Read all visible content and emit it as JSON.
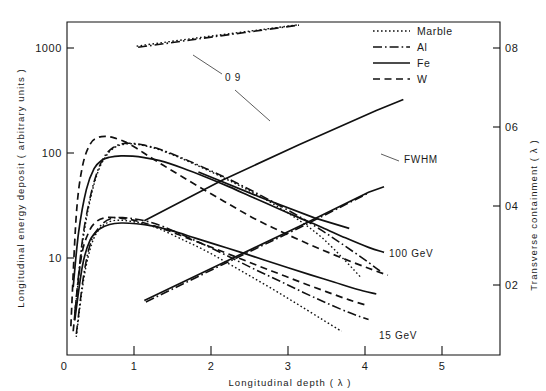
{
  "figure": {
    "title": "",
    "axes": {
      "x": {
        "label": "Longitudinal  depth  ( λ )",
        "ticks": [
          "0",
          "1",
          "2",
          "3",
          "4",
          "5"
        ],
        "values": [
          0,
          1,
          2,
          3,
          4,
          5
        ],
        "range": [
          0,
          5.6
        ],
        "scale": "linear"
      },
      "y_left": {
        "label": "Longitudinal  energy  deposit  ( arbitrary  units )",
        "ticks": [
          "10",
          "100",
          "1000"
        ],
        "values": [
          10,
          100,
          1000
        ],
        "range": [
          2.2,
          2200
        ],
        "scale": "log"
      },
      "y_right": {
        "label": "Transverse  containment  ( λ )",
        "ticks": [
          "02",
          "04",
          "06",
          "08"
        ],
        "values": [
          0.2,
          0.4,
          0.6,
          0.8
        ],
        "range": [
          0.0,
          0.855
        ],
        "scale": "linear"
      }
    },
    "legend": {
      "position": "top-right",
      "items": [
        {
          "label": "Marble",
          "style": "dotted",
          "key": "marble"
        },
        {
          "label": "Al",
          "style": "dash-dot",
          "key": "al"
        },
        {
          "label": "Fe",
          "style": "solid",
          "key": "fe"
        },
        {
          "label": "W",
          "style": "dashed",
          "key": "w"
        }
      ]
    },
    "annotations": [
      {
        "name": "containment-09",
        "text": "0 9",
        "x": 225,
        "y": 81
      },
      {
        "name": "fwhm",
        "text": "FWHM",
        "x": 404,
        "y": 163
      },
      {
        "name": "energy-100gev",
        "text": "100 GeV",
        "x": 389,
        "y": 257
      },
      {
        "name": "energy-15gev",
        "text": "15 GeV",
        "x": 379,
        "y": 339
      }
    ]
  },
  "chart_data": {
    "type": "line",
    "title": "",
    "xlabel": "Longitudinal depth ( λ )",
    "ylabel": "Longitudinal energy deposit ( arbitrary units )",
    "ylabel_right": "Transverse containment ( λ )",
    "xlim": [
      0,
      5.6
    ],
    "ylim": [
      2.2,
      2200
    ],
    "ylim_right": [
      0.0,
      0.855
    ],
    "yscale": "log",
    "grid": false,
    "legend_position": "top-right",
    "legend": [
      "Marble",
      "Al",
      "Fe",
      "W"
    ],
    "annotations": [
      "0 9",
      "FWHM",
      "100 GeV",
      "15 GeV"
    ],
    "series": [
      {
        "name": "Marble 100 GeV longitudinal deposit",
        "material": "Marble",
        "energy": "100 GeV",
        "axis": "left",
        "style": "dotted",
        "x": [
          0.1,
          0.2,
          0.3,
          0.4,
          0.5,
          0.6,
          0.7,
          0.8,
          0.9,
          1.0,
          1.2,
          1.5,
          1.8,
          2.1,
          2.4,
          2.7,
          3.0,
          3.3,
          3.6,
          3.8
        ],
        "y": [
          5.0,
          22,
          55,
          98,
          135,
          160,
          172,
          176,
          174,
          169,
          155,
          128,
          103,
          82,
          64,
          49,
          36,
          25,
          15.5,
          11.0
        ]
      },
      {
        "name": "Al 100 GeV longitudinal deposit",
        "material": "Al",
        "energy": "100 GeV",
        "axis": "left",
        "style": "dash-dot",
        "x": [
          0.1,
          0.2,
          0.3,
          0.4,
          0.5,
          0.6,
          0.7,
          0.8,
          0.9,
          1.0,
          1.2,
          1.5,
          1.8,
          2.1,
          2.4,
          2.7,
          3.0,
          3.3,
          3.6,
          3.9,
          4.05
        ],
        "y": [
          5.2,
          24,
          58,
          102,
          140,
          163,
          175,
          178,
          176,
          171,
          157,
          130,
          105,
          84,
          66,
          51,
          39,
          29,
          21,
          15,
          12.5
        ]
      },
      {
        "name": "Fe 100 GeV longitudinal deposit",
        "material": "Fe",
        "energy": "100 GeV",
        "axis": "left",
        "style": "solid",
        "x": [
          0.08,
          0.15,
          0.25,
          0.35,
          0.45,
          0.55,
          0.7,
          0.85,
          1.0,
          1.2,
          1.5,
          1.8,
          2.1,
          2.4,
          2.7,
          3.0,
          3.3,
          3.6,
          3.9,
          4.1
        ],
        "y": [
          9,
          28,
          68,
          105,
          125,
          133,
          137,
          136,
          132,
          124,
          106,
          88,
          72,
          58,
          47,
          38,
          31,
          25,
          20.5,
          18.5
        ]
      },
      {
        "name": "W 100 GeV longitudinal deposit",
        "material": "W",
        "energy": "100 GeV",
        "axis": "left",
        "style": "dashed",
        "x": [
          0.05,
          0.12,
          0.2,
          0.3,
          0.4,
          0.5,
          0.6,
          0.75,
          0.9,
          1.05,
          1.25,
          1.5,
          1.8,
          2.1,
          2.4,
          2.7,
          3.0,
          3.3,
          3.6,
          3.9,
          4.15
        ],
        "y": [
          4.0,
          40,
          110,
          175,
          200,
          205,
          200,
          183,
          160,
          137,
          112,
          88,
          66,
          50,
          38,
          30,
          24,
          19.5,
          16.0,
          13.3,
          11.5
        ]
      },
      {
        "name": "Marble 15 GeV longitudinal deposit",
        "material": "Marble",
        "energy": "15 GeV",
        "axis": "left",
        "style": "dotted",
        "x": [
          0.12,
          0.22,
          0.32,
          0.42,
          0.55,
          0.7,
          0.85,
          1.0,
          1.2,
          1.5,
          1.8,
          2.1,
          2.4,
          2.7,
          3.0,
          3.3,
          3.55
        ],
        "y": [
          3.2,
          11,
          22,
          30,
          35,
          36,
          35,
          33.5,
          30,
          24,
          19,
          14.5,
          11.0,
          8.3,
          6.2,
          4.6,
          3.6
        ]
      },
      {
        "name": "Al 15 GeV longitudinal deposit",
        "material": "Al",
        "energy": "15 GeV",
        "axis": "left",
        "style": "dash-dot",
        "x": [
          0.12,
          0.22,
          0.32,
          0.45,
          0.58,
          0.72,
          0.88,
          1.05,
          1.25,
          1.55,
          1.85,
          2.15,
          2.45,
          2.75,
          3.05,
          3.35,
          3.65,
          3.9
        ],
        "y": [
          3.4,
          12,
          24,
          33,
          37.5,
          38,
          37,
          35,
          31.5,
          25.5,
          20.5,
          16.2,
          12.8,
          10.2,
          8.1,
          6.5,
          5.3,
          4.6
        ]
      },
      {
        "name": "Fe 15 GeV longitudinal deposit",
        "material": "Fe",
        "energy": "15 GeV",
        "axis": "left",
        "style": "solid",
        "x": [
          0.1,
          0.2,
          0.3,
          0.42,
          0.55,
          0.7,
          0.9,
          1.1,
          1.35,
          1.65,
          1.95,
          2.25,
          2.55,
          2.85,
          3.15,
          3.45,
          3.75,
          4.0
        ],
        "y": [
          4.5,
          14,
          24,
          30,
          33,
          34,
          33.5,
          32,
          29,
          25,
          21.5,
          18.5,
          15.8,
          13.5,
          11.6,
          10.0,
          8.6,
          7.8
        ]
      },
      {
        "name": "W 15 GeV longitudinal deposit",
        "material": "W",
        "energy": "15 GeV",
        "axis": "left",
        "style": "dashed",
        "x": [
          0.08,
          0.18,
          0.28,
          0.38,
          0.5,
          0.65,
          0.82,
          1.0,
          1.25,
          1.55,
          1.85,
          2.15,
          2.45,
          2.75,
          3.05,
          3.35,
          3.65,
          3.9
        ],
        "y": [
          3.6,
          16,
          28,
          35,
          38,
          38,
          36.5,
          34,
          30,
          25,
          20.8,
          17.2,
          14.2,
          11.8,
          9.8,
          8.2,
          6.9,
          6.1
        ]
      },
      {
        "name": "Marble 0.9 transverse containment",
        "material": "Marble",
        "quantity": "0.9 containment",
        "axis": "right",
        "style": "dotted",
        "x": [
          0.9,
          1.6,
          2.3,
          3.0,
          3.55
        ],
        "y": [
          0.793,
          0.812,
          0.83,
          0.848,
          0.862
        ]
      },
      {
        "name": "Al 0.9 transverse containment",
        "material": "Al",
        "quantity": "0.9 containment",
        "axis": "right",
        "style": "dash-dot",
        "x": [
          0.92,
          1.6,
          2.3,
          3.0,
          3.55
        ],
        "y": [
          0.79,
          0.809,
          0.828,
          0.847,
          0.861
        ]
      },
      {
        "name": "Fe 0.9 transverse containment",
        "material": "Fe",
        "quantity": "0.9 containment",
        "axis": "right",
        "style": "solid",
        "x": [
          1.0,
          2.0,
          3.0,
          4.0,
          4.35
        ],
        "y": [
          0.345,
          0.448,
          0.54,
          0.628,
          0.656
        ]
      },
      {
        "name": "FWHM transverse width",
        "quantity": "FWHM",
        "axis": "right",
        "style": "solid",
        "x": [
          1.0,
          2.0,
          3.0,
          3.9,
          4.1
        ],
        "y": [
          0.14,
          0.235,
          0.33,
          0.418,
          0.432
        ]
      },
      {
        "name": "FWHM transverse width Al",
        "quantity": "FWHM",
        "axis": "right",
        "style": "dash-dot",
        "x": [
          1.02,
          2.0,
          3.0,
          3.88
        ],
        "y": [
          0.136,
          0.231,
          0.326,
          0.414
        ]
      },
      {
        "name": "Fe containment falling 100 GeV",
        "quantity": "containment",
        "axis": "right",
        "style": "solid",
        "x": [
          1.7,
          2.5,
          3.2,
          3.65
        ],
        "y": [
          0.47,
          0.405,
          0.352,
          0.325
        ]
      }
    ]
  }
}
